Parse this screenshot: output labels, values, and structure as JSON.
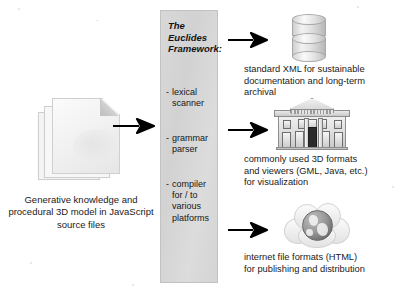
{
  "diagram": {
    "input": {
      "icon": "document-stack-icon",
      "caption": "Generative knowledge\nand procedural 3D\nmodel in JavaScript\nsource files"
    },
    "framework": {
      "title": "The Euclides\nFramework:",
      "stages": [
        {
          "label": "lexical\nscanner"
        },
        {
          "label": "grammar\nparser"
        },
        {
          "label": "compiler\nfor / to\nvarious\nplatforms"
        }
      ],
      "panel_color": "#d6d6d6"
    },
    "arrows": {
      "input_to_framework": "arrow-right-icon",
      "framework_to_output_0": "arrow-right-icon",
      "framework_to_output_1": "arrow-right-icon",
      "framework_to_output_2": "arrow-right-icon"
    },
    "outputs": [
      {
        "icon": "database-cylinder-icon",
        "caption": "standard XML for sustainable\ndocumentation and long-term\narchival"
      },
      {
        "icon": "classical-building-icon",
        "caption": "commonly used 3D formats\nand viewers (GML, Java, etc.)\nfor visualization"
      },
      {
        "icon": "internet-globe-cloud-icon",
        "caption": "internet file formats (HTML)\nfor publishing and distribution"
      }
    ]
  }
}
